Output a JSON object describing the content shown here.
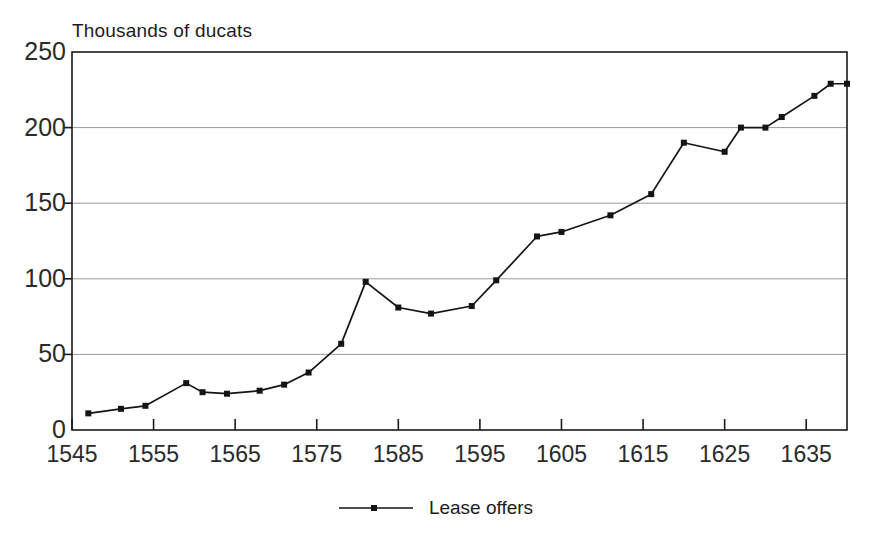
{
  "chart_data": {
    "type": "line",
    "title": "",
    "ylabel": "Thousands of ducats",
    "xlabel": "",
    "xlim": [
      1545,
      1640
    ],
    "ylim": [
      0,
      250
    ],
    "grid": true,
    "legend_position": "bottom",
    "y_ticks": [
      0,
      50,
      100,
      150,
      200,
      250
    ],
    "x_ticks": [
      1545,
      1555,
      1565,
      1575,
      1585,
      1595,
      1605,
      1615,
      1625,
      1635
    ],
    "series": [
      {
        "name": "Lease offers",
        "color": "#141414",
        "marker": "square",
        "x": [
          1547,
          1551,
          1554,
          1559,
          1561,
          1564,
          1568,
          1571,
          1574,
          1578,
          1581,
          1585,
          1589,
          1594,
          1597,
          1602,
          1605,
          1611,
          1616,
          1620,
          1625,
          1627,
          1630,
          1632,
          1636,
          1638,
          1640
        ],
        "values": [
          11,
          14,
          16,
          31,
          25,
          24,
          26,
          30,
          38,
          57,
          98,
          81,
          77,
          82,
          99,
          128,
          131,
          142,
          156,
          190,
          184,
          200,
          200,
          207,
          221,
          229,
          229
        ]
      }
    ]
  },
  "axis_title": {
    "text": "Thousands of ducats"
  },
  "y_axis": {
    "labels": [
      "250",
      "200",
      "150",
      "100",
      "50",
      "0"
    ]
  },
  "x_axis": {
    "labels": [
      "1545",
      "1555",
      "1565",
      "1575",
      "1585",
      "1595",
      "1605",
      "1615",
      "1625",
      "1635"
    ]
  },
  "legend": {
    "series_label": "Lease offers",
    "symbol": "line-with-square-marker"
  },
  "colors": {
    "line": "#141414",
    "grid": "#9a9a9a",
    "frame": "#1a1a1a",
    "text": "#1c1c1c",
    "background": "#ffffff"
  }
}
